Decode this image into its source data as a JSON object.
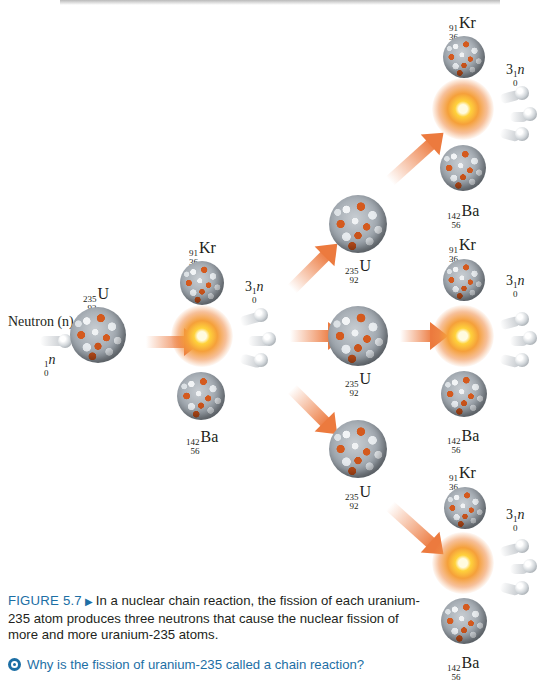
{
  "top_partial_line": "(clipped line of body text from preceding paragraph)",
  "figure": {
    "initial": {
      "neutron_label": "Neutron (n)",
      "neutron_symbol": {
        "mass": "1",
        "atomic": "0",
        "symbol": "n"
      },
      "target": {
        "mass": "235",
        "atomic": "92",
        "symbol": "U"
      }
    },
    "products": {
      "krypton": {
        "mass": "91",
        "atomic": "36",
        "symbol": "Kr"
      },
      "barium": {
        "mass": "142",
        "atomic": "56",
        "symbol": "Ba"
      },
      "neutrons": {
        "coefficient": "3",
        "mass": "1",
        "atomic": "0",
        "symbol": "n"
      }
    },
    "second_generation_uranium": [
      {
        "mass": "235",
        "atomic": "92",
        "symbol": "U"
      },
      {
        "mass": "235",
        "atomic": "92",
        "symbol": "U"
      },
      {
        "mass": "235",
        "atomic": "92",
        "symbol": "U"
      }
    ],
    "colors": {
      "arrow": "#ec7a3e",
      "proton": "#d45a1e",
      "neutron": "#e8ecef",
      "caption_accent": "#1d6fa5"
    }
  },
  "caption": {
    "figure_number": "FIGURE 5.7",
    "text": "In a nuclear chain reaction, the fission of each uranium-235 atom produces three neutrons that cause the nuclear fission of more and more uranium-235 atoms.",
    "question": "Why is the fission of uranium-235 called a chain reaction?"
  }
}
